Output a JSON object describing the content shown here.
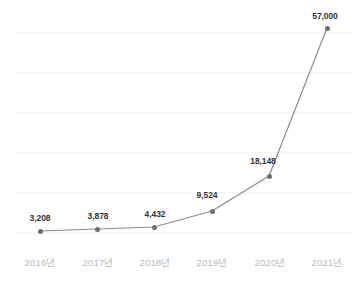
{
  "chart_data": {
    "type": "line",
    "title": "",
    "subtitle": "",
    "xlabel": "",
    "ylabel": "",
    "categories": [
      "2016년",
      "2017년",
      "2018년",
      "2019년",
      "2020년",
      "2021년"
    ],
    "values": [
      3208,
      3878,
      4432,
      9524,
      18148,
      57000
    ],
    "point_labels": [
      "3,208",
      "3,878",
      "4,432",
      "9,524",
      "18,148",
      "57,000"
    ],
    "series": [
      {
        "name": "",
        "values": [
          3208,
          3878,
          4432,
          9524,
          18148,
          57000
        ]
      }
    ],
    "ylim": [
      0,
      60000
    ],
    "grid": true,
    "gridline_count": 6,
    "legend": "none",
    "legend_position": "none",
    "annotations": [],
    "colors": {
      "line": "#8c8c90",
      "marker": "#6f6f73",
      "label_text": "#333335",
      "tick_text": "#b9babd",
      "gridline": "#f4f5f7",
      "background": "#ffffff"
    },
    "points": [
      {
        "category": "2016년",
        "value": 3208,
        "label": "3,208",
        "x": 40,
        "y": 231,
        "label_x": 40,
        "label_y": 213
      },
      {
        "category": "2017년",
        "value": 3878,
        "label": "3,878",
        "x": 97,
        "y": 229,
        "label_x": 98,
        "label_y": 211
      },
      {
        "category": "2018년",
        "value": 4432,
        "label": "4,432",
        "x": 154,
        "y": 227,
        "label_x": 155,
        "label_y": 209
      },
      {
        "category": "2019년",
        "value": 9524,
        "label": "9,524",
        "x": 212,
        "y": 211,
        "label_x": 207,
        "label_y": 190
      },
      {
        "category": "2020년",
        "value": 18148,
        "label": "18,148",
        "x": 269,
        "y": 176,
        "label_x": 263,
        "label_y": 156
      },
      {
        "category": "2021년",
        "value": 57000,
        "label": "57,000",
        "x": 327,
        "y": 28,
        "label_x": 325,
        "label_y": 11
      }
    ],
    "gridlines_y": [
      32,
      72,
      112,
      152,
      192,
      232
    ],
    "x_ticks": [
      {
        "label": "2016년",
        "x": 40
      },
      {
        "label": "2017년",
        "x": 98
      },
      {
        "label": "2018년",
        "x": 155
      },
      {
        "label": "2019년",
        "x": 212
      },
      {
        "label": "2020년",
        "x": 270
      },
      {
        "label": "2021년",
        "x": 327
      }
    ]
  }
}
